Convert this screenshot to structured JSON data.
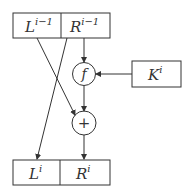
{
  "diagram": {
    "type": "feistel-round",
    "colors": {
      "stroke": "#333333",
      "background": "#ffffff"
    },
    "top_block": {
      "left": {
        "base": "L",
        "sup": "i−1"
      },
      "right": {
        "base": "R",
        "sup": "i−1"
      }
    },
    "key_block": {
      "base": "K",
      "sup": "i"
    },
    "function_node": {
      "label": "f"
    },
    "xor_node": {
      "label": "+"
    },
    "bottom_block": {
      "left": {
        "base": "L",
        "sup": "i"
      },
      "right": {
        "base": "R",
        "sup": "i"
      }
    },
    "edges": [
      {
        "from": "top_block.right",
        "to": "function_node"
      },
      {
        "from": "key_block",
        "to": "function_node"
      },
      {
        "from": "function_node",
        "to": "xor_node"
      },
      {
        "from": "top_block.left",
        "to": "xor_node"
      },
      {
        "from": "top_block.right",
        "to": "bottom_block.left"
      },
      {
        "from": "xor_node",
        "to": "bottom_block.right"
      }
    ]
  }
}
